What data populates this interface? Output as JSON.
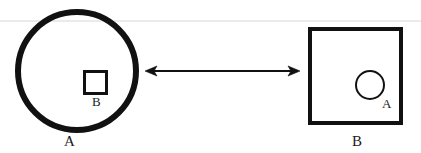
{
  "figure": {
    "background_color": "#ffffff",
    "stroke_color": "#111111",
    "rule_color": "#d6d6d6",
    "width": 421,
    "height": 153
  },
  "diagram_data": {
    "type": "diagram",
    "description": "Two set-containment shapes connected by a double-headed arrow",
    "shapes": [
      {
        "id": "outer-circle-a",
        "kind": "circle",
        "label": "A",
        "label_position": "below",
        "stroke_width": 6,
        "cx": 77,
        "cy": 71,
        "r": 59
      },
      {
        "id": "inner-square-b",
        "kind": "square",
        "label": "B",
        "label_position": "below-right",
        "stroke_width": 3,
        "x": 84,
        "y": 71,
        "w": 23,
        "h": 23
      },
      {
        "id": "outer-square-b",
        "kind": "square",
        "label": "B",
        "label_position": "below",
        "stroke_width": 4,
        "x": 308,
        "y": 27,
        "w": 94,
        "h": 97
      },
      {
        "id": "inner-circle-a",
        "kind": "circle",
        "label": "A",
        "label_position": "below-right",
        "stroke_width": 2,
        "cx": 370,
        "cy": 85,
        "r": 14
      }
    ],
    "connector": {
      "id": "double-arrow",
      "kind": "double-headed-arrow",
      "x1": 145,
      "x2": 300,
      "y": 71,
      "stroke_width": 2
    },
    "rule": {
      "id": "horizontal-rule",
      "x1": 0,
      "x2": 421,
      "y": 21
    }
  },
  "labels": {
    "shape_a_outer": "A",
    "shape_b_inner": "B",
    "shape_b_outer": "B",
    "shape_a_inner": "A"
  }
}
